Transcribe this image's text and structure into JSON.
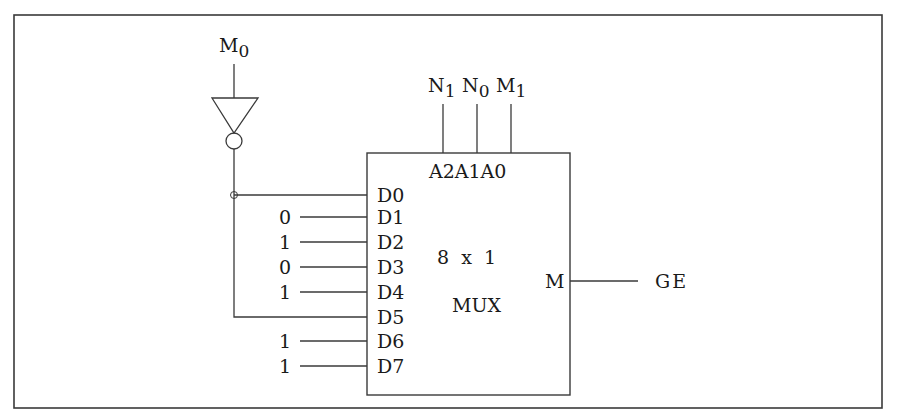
{
  "diagram": {
    "type": "circuit",
    "component": {
      "title": "8 x 1",
      "subtitle": "MUX",
      "output_pin": "M"
    },
    "select_lines": [
      {
        "pin": "A2",
        "signal": "N",
        "sub": "1"
      },
      {
        "pin": "A1",
        "signal": "N",
        "sub": "0"
      },
      {
        "pin": "A0",
        "signal": "M",
        "sub": "1"
      }
    ],
    "select_pins_label": "A2A1A0",
    "inverter_input": {
      "signal": "M",
      "sub": "0"
    },
    "data_inputs": [
      {
        "pin": "D0",
        "value": "M0'",
        "label": ""
      },
      {
        "pin": "D1",
        "value": "0",
        "label": "0"
      },
      {
        "pin": "D2",
        "value": "1",
        "label": "1"
      },
      {
        "pin": "D3",
        "value": "0",
        "label": "0"
      },
      {
        "pin": "D4",
        "value": "1",
        "label": "1"
      },
      {
        "pin": "D5",
        "value": "M0'",
        "label": ""
      },
      {
        "pin": "D6",
        "value": "1",
        "label": "1"
      },
      {
        "pin": "D7",
        "value": "1",
        "label": "1"
      }
    ],
    "output_signal": "GE",
    "colors": {
      "stroke": "#3a3a3a",
      "text": "#1a1a1a",
      "background": "#ffffff"
    }
  }
}
